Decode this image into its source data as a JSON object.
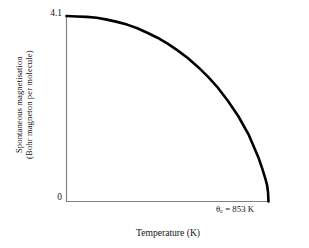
{
  "figure": {
    "background_color": "#ffffff",
    "axis_color": "#808080",
    "curve_color": "#000000"
  },
  "axes": {
    "y_tick_top": "4.1",
    "y_tick_zero": "0",
    "y_axis_label_line1": "Spontaneous magnetisation",
    "y_axis_label_line2": "(Bohr magneton per molecule)",
    "x_axis_label": "Temperature (K)"
  },
  "annotations": {
    "curie_symbol": "θ",
    "curie_subscript": "c",
    "curie_equals_value": " = 853 K",
    "curie_full": "θc = 853 K"
  },
  "chart_data": {
    "type": "line",
    "title": "",
    "subtitle": "",
    "xlabel": "Temperature (K)",
    "ylabel": "Spontaneous magnetisation (Bohr magneton per molecule)",
    "xlim": [
      0,
      853
    ],
    "ylim": [
      0,
      4.1
    ],
    "xticks": [
      0,
      853
    ],
    "xticklabels": [
      "0",
      "θc = 853 K"
    ],
    "yticks": [
      0,
      4.1
    ],
    "yticklabels": [
      "0",
      "4.1"
    ],
    "grid": false,
    "legend": false,
    "legend_position": "none",
    "annotations": [
      {
        "text": "θc = 853 K",
        "x": 853,
        "y": 0,
        "description": "Curie temperature marked at the point where spontaneous magnetisation falls to zero"
      }
    ],
    "series": [
      {
        "name": "Spontaneous magnetisation",
        "color": "#000000",
        "line_width": 2.6,
        "x": [
          0,
          43,
          85,
          128,
          171,
          213,
          256,
          299,
          341,
          384,
          427,
          469,
          512,
          554,
          597,
          640,
          682,
          725,
          768,
          810,
          827,
          840,
          847,
          851,
          853
        ],
        "y": [
          4.1,
          4.09,
          4.08,
          4.06,
          4.02,
          3.97,
          3.91,
          3.83,
          3.73,
          3.62,
          3.49,
          3.34,
          3.17,
          2.98,
          2.76,
          2.51,
          2.22,
          1.89,
          1.49,
          0.98,
          0.72,
          0.5,
          0.36,
          0.2,
          0.0
        ]
      }
    ]
  }
}
